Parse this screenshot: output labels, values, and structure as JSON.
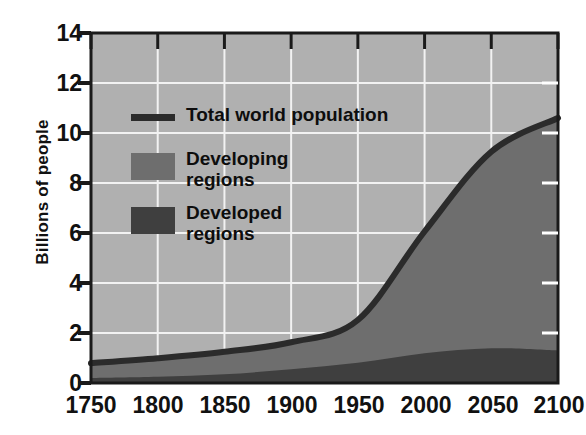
{
  "chart_data": {
    "type": "area",
    "title": "",
    "subtitle": "",
    "xlabel": "",
    "ylabel": "Billions of people",
    "xlim": [
      1750,
      2100
    ],
    "ylim": [
      0,
      14
    ],
    "xticks": [
      1750,
      1800,
      1850,
      1900,
      1950,
      2000,
      2050,
      2100
    ],
    "yticks": [
      0,
      2,
      4,
      6,
      8,
      10,
      12,
      14
    ],
    "grid": true,
    "legend_position": "upper-left-inside",
    "x": [
      1750,
      1800,
      1850,
      1900,
      1950,
      2000,
      2050,
      2100
    ],
    "series": [
      {
        "name": "Developed regions",
        "kind": "stacked-area-bottom",
        "color": "#3f3f3f",
        "values": [
          0.2,
          0.25,
          0.35,
          0.55,
          0.81,
          1.19,
          1.39,
          1.3
        ]
      },
      {
        "name": "Developing regions",
        "kind": "stacked-area-top",
        "color": "#6e6e6e",
        "values": [
          0.59,
          0.74,
          0.9,
          1.08,
          1.71,
          4.87,
          7.86,
          9.3
        ]
      },
      {
        "name": "Total world population",
        "kind": "line",
        "color": "#2b2b2b",
        "values": [
          0.79,
          0.99,
          1.25,
          1.63,
          2.52,
          6.06,
          9.25,
          10.6
        ]
      }
    ],
    "plot_background": "#b0b0b0",
    "grid_color": "#f2f2f2",
    "axis_color": "#1a1a1a"
  },
  "legend": {
    "items": [
      {
        "label": "Total world population",
        "marker": "line",
        "color": "#2b2b2b"
      },
      {
        "label": "Developing\nregions",
        "marker": "swatch",
        "color": "#6e6e6e"
      },
      {
        "label": "Developed\nregions",
        "marker": "swatch",
        "color": "#3f3f3f"
      }
    ]
  },
  "axes": {
    "y_title": "Billions of people",
    "y_tick_labels": [
      "14",
      "12",
      "10",
      "8",
      "6",
      "4",
      "2",
      "0"
    ],
    "x_tick_labels": [
      "1750",
      "1800",
      "1850",
      "1900",
      "1950",
      "2000",
      "2050",
      "2100"
    ]
  }
}
